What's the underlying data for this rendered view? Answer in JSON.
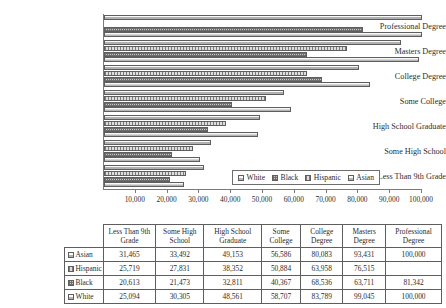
{
  "chart_data": {
    "type": "bar",
    "orientation": "horizontal",
    "title": "",
    "xlabel": "",
    "ylabel": "",
    "xlim": [
      0,
      100000
    ],
    "xticks": [
      "10,000",
      "20,000",
      "30,000",
      "40,000",
      "50,000",
      "60,000",
      "70,000",
      "80,000",
      "90,000",
      "100,000"
    ],
    "xtick_values": [
      10000,
      20000,
      30000,
      40000,
      50000,
      60000,
      70000,
      80000,
      90000,
      100000
    ],
    "grid": false,
    "legend_position": "inside-bottom-right",
    "categories": [
      "Professional Degree",
      "Masters Degree",
      "College Degree",
      "Some College",
      "High School Graduate",
      "Some High School",
      "Less Than 9th Grade"
    ],
    "series": [
      {
        "name": "Asian",
        "pattern": "p-asian",
        "values": [
          100000,
          93431,
          80083,
          56586,
          49153,
          33492,
          31465
        ]
      },
      {
        "name": "Hispanic",
        "pattern": "p-hispanic",
        "values": [
          null,
          76515,
          63958,
          50884,
          38352,
          27831,
          25719
        ]
      },
      {
        "name": "Black",
        "pattern": "p-black",
        "values": [
          81342,
          63711,
          68536,
          40367,
          32811,
          21473,
          20613
        ]
      },
      {
        "name": "White",
        "pattern": "p-white",
        "values": [
          100000,
          99045,
          83789,
          58707,
          48561,
          30305,
          25094
        ]
      }
    ]
  },
  "legend": {
    "items": [
      {
        "label": "White",
        "pattern": "p-white"
      },
      {
        "label": "Black",
        "pattern": "p-black"
      },
      {
        "label": "Hispanic",
        "pattern": "p-hispanic"
      },
      {
        "label": "Asian",
        "pattern": "p-asian"
      }
    ]
  },
  "table": {
    "columns": [
      "Less Than 9th Grade",
      "Some High School",
      "High School Graduate",
      "Some College",
      "College Degree",
      "Masters Degree",
      "Professional Degree"
    ],
    "rows": [
      {
        "label": "Asian",
        "pattern": "p-asian",
        "cells": [
          "31,465",
          "33,492",
          "49,153",
          "56,586",
          "80,083",
          "93,431",
          "100,000"
        ]
      },
      {
        "label": "Hispanic",
        "pattern": "p-hispanic",
        "cells": [
          "25,719",
          "27,831",
          "38,352",
          "50,884",
          "63,958",
          "76,515",
          ""
        ]
      },
      {
        "label": "Black",
        "pattern": "p-black",
        "cells": [
          "20,613",
          "21,473",
          "32,811",
          "40,367",
          "68,536",
          "63,711",
          "81,342"
        ]
      },
      {
        "label": "White",
        "pattern": "p-white",
        "cells": [
          "25,094",
          "30,305",
          "48,561",
          "58,707",
          "83,789",
          "99,045",
          "100,000"
        ]
      }
    ]
  }
}
